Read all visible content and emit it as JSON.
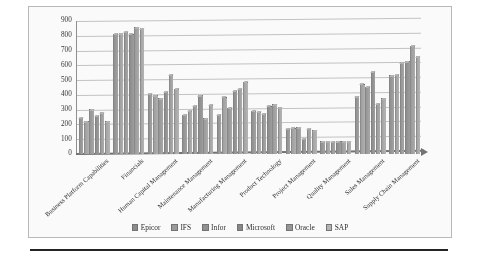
{
  "chart_data": {
    "type": "bar",
    "title": "",
    "xlabel": "",
    "ylabel": "",
    "ylim": [
      0,
      900
    ],
    "yticks": [
      0,
      100,
      200,
      300,
      400,
      500,
      600,
      700,
      800,
      900
    ],
    "ytick_labels": [
      "0",
      "100",
      "200",
      "300",
      "400",
      "500",
      "600",
      "700",
      "800",
      "900"
    ],
    "grid": true,
    "legend_position": "bottom",
    "categories": [
      "Business Platform Capabilities",
      "Financials",
      "Human Capital Management",
      "Maintenance Management",
      "Manufacturing Management",
      "Product Technology",
      "Project Management",
      "Quality Management",
      "Sales Management",
      "Supply Chain Management"
    ],
    "series": [
      {
        "name": "Epicor",
        "color": "#8a8a8a",
        "values": [
          240,
          805,
          400,
          260,
          260,
          285,
          165,
          80,
          385,
          525
        ]
      },
      {
        "name": "IFS",
        "color": "#9a9a9a",
        "values": [
          215,
          810,
          390,
          285,
          380,
          280,
          170,
          78,
          470,
          530
        ]
      },
      {
        "name": "Infor",
        "color": "#8f8f8f",
        "values": [
          295,
          820,
          370,
          320,
          305,
          265,
          175,
          76,
          450,
          615
        ]
      },
      {
        "name": "Microsoft",
        "color": "#858585",
        "values": [
          250,
          805,
          415,
          390,
          420,
          320,
          95,
          78,
          550,
          620
        ]
      },
      {
        "name": "Oracle",
        "color": "#959595",
        "values": [
          275,
          850,
          530,
          235,
          435,
          330,
          165,
          80,
          335,
          725
        ]
      },
      {
        "name": "SAP",
        "color": "#b5b5b5",
        "values": [
          215,
          845,
          435,
          325,
          480,
          310,
          155,
          80,
          370,
          655
        ]
      }
    ]
  },
  "legend": {
    "items": [
      "Epicor",
      "IFS",
      "Infor",
      "Microsoft",
      "Oracle",
      "SAP"
    ]
  }
}
